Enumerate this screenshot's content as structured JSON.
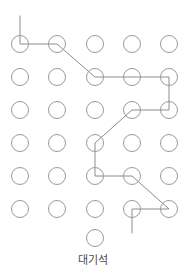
{
  "diagram": {
    "type": "seat-grid",
    "caption": "대기석",
    "colors": {
      "seat_stroke": "#9a9a9a",
      "path_stroke": "#8c8c8c",
      "background": "#ffffff",
      "caption_text": "#4a4a4a"
    },
    "geometry": {
      "width": 186,
      "height": 279,
      "seat_radius": 8.5,
      "seat_stroke_width": 1,
      "path_stroke_width": 1,
      "col_x": [
        20,
        57,
        95,
        132,
        169
      ],
      "row_y": [
        44,
        77,
        110,
        143,
        176,
        209
      ],
      "standalone_seat": {
        "x": 95,
        "y": 238
      },
      "caption_y": 254
    },
    "grid": {
      "columns": 5,
      "rows": 6,
      "total_seats": 30,
      "extra_seats": 1
    },
    "seats": [
      {
        "id": "r1c1",
        "row": 1,
        "col": 1,
        "x": 20,
        "y": 44,
        "on_path": true
      },
      {
        "id": "r1c2",
        "row": 1,
        "col": 2,
        "x": 57,
        "y": 44,
        "on_path": true
      },
      {
        "id": "r1c3",
        "row": 1,
        "col": 3,
        "x": 95,
        "y": 44,
        "on_path": false
      },
      {
        "id": "r1c4",
        "row": 1,
        "col": 4,
        "x": 132,
        "y": 44,
        "on_path": false
      },
      {
        "id": "r1c5",
        "row": 1,
        "col": 5,
        "x": 169,
        "y": 44,
        "on_path": false
      },
      {
        "id": "r2c1",
        "row": 2,
        "col": 1,
        "x": 20,
        "y": 77,
        "on_path": false
      },
      {
        "id": "r2c2",
        "row": 2,
        "col": 2,
        "x": 57,
        "y": 77,
        "on_path": false
      },
      {
        "id": "r2c3",
        "row": 2,
        "col": 3,
        "x": 95,
        "y": 77,
        "on_path": true
      },
      {
        "id": "r2c4",
        "row": 2,
        "col": 4,
        "x": 132,
        "y": 77,
        "on_path": true
      },
      {
        "id": "r2c5",
        "row": 2,
        "col": 5,
        "x": 169,
        "y": 77,
        "on_path": true
      },
      {
        "id": "r3c1",
        "row": 3,
        "col": 1,
        "x": 20,
        "y": 110,
        "on_path": false
      },
      {
        "id": "r3c2",
        "row": 3,
        "col": 2,
        "x": 57,
        "y": 110,
        "on_path": false
      },
      {
        "id": "r3c3",
        "row": 3,
        "col": 3,
        "x": 95,
        "y": 110,
        "on_path": false
      },
      {
        "id": "r3c4",
        "row": 3,
        "col": 4,
        "x": 132,
        "y": 110,
        "on_path": true
      },
      {
        "id": "r3c5",
        "row": 3,
        "col": 5,
        "x": 169,
        "y": 110,
        "on_path": true
      },
      {
        "id": "r4c1",
        "row": 4,
        "col": 1,
        "x": 20,
        "y": 143,
        "on_path": false
      },
      {
        "id": "r4c2",
        "row": 4,
        "col": 2,
        "x": 57,
        "y": 143,
        "on_path": false
      },
      {
        "id": "r4c3",
        "row": 4,
        "col": 3,
        "x": 95,
        "y": 143,
        "on_path": true
      },
      {
        "id": "r4c4",
        "row": 4,
        "col": 4,
        "x": 132,
        "y": 143,
        "on_path": false
      },
      {
        "id": "r4c5",
        "row": 4,
        "col": 5,
        "x": 169,
        "y": 143,
        "on_path": false
      },
      {
        "id": "r5c1",
        "row": 5,
        "col": 1,
        "x": 20,
        "y": 176,
        "on_path": false
      },
      {
        "id": "r5c2",
        "row": 5,
        "col": 2,
        "x": 57,
        "y": 176,
        "on_path": false
      },
      {
        "id": "r5c3",
        "row": 5,
        "col": 3,
        "x": 95,
        "y": 176,
        "on_path": true
      },
      {
        "id": "r5c4",
        "row": 5,
        "col": 4,
        "x": 132,
        "y": 176,
        "on_path": true
      },
      {
        "id": "r5c5",
        "row": 5,
        "col": 5,
        "x": 169,
        "y": 176,
        "on_path": false
      },
      {
        "id": "r6c1",
        "row": 6,
        "col": 1,
        "x": 20,
        "y": 209,
        "on_path": false
      },
      {
        "id": "r6c2",
        "row": 6,
        "col": 2,
        "x": 57,
        "y": 209,
        "on_path": false
      },
      {
        "id": "r6c3",
        "row": 6,
        "col": 3,
        "x": 95,
        "y": 209,
        "on_path": false
      },
      {
        "id": "r6c4",
        "row": 6,
        "col": 4,
        "x": 132,
        "y": 209,
        "on_path": true
      },
      {
        "id": "r6c5",
        "row": 6,
        "col": 5,
        "x": 169,
        "y": 209,
        "on_path": true
      },
      {
        "id": "wait1",
        "row": 7,
        "col": 3,
        "x": 95,
        "y": 238,
        "on_path": false
      }
    ],
    "path": {
      "label": "connection-path",
      "points": [
        {
          "x": 20,
          "y": 16
        },
        {
          "x": 20,
          "y": 44
        },
        {
          "x": 57,
          "y": 44
        },
        {
          "x": 95,
          "y": 77
        },
        {
          "x": 132,
          "y": 77
        },
        {
          "x": 169,
          "y": 77
        },
        {
          "x": 169,
          "y": 110
        },
        {
          "x": 132,
          "y": 110
        },
        {
          "x": 95,
          "y": 143
        },
        {
          "x": 95,
          "y": 176
        },
        {
          "x": 132,
          "y": 176
        },
        {
          "x": 169,
          "y": 209
        },
        {
          "x": 132,
          "y": 209
        },
        {
          "x": 132,
          "y": 233
        }
      ]
    }
  }
}
